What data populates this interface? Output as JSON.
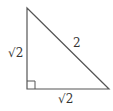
{
  "diagram": {
    "type": "right-triangle",
    "vertices": {
      "top": [
        27,
        8
      ],
      "right_angle": [
        27,
        89
      ],
      "right": [
        109,
        89
      ]
    },
    "right_angle_marker": true,
    "labels": {
      "left_leg": "√2",
      "bottom_leg": "√2",
      "hypotenuse": "2"
    },
    "stroke_color": "#555555",
    "label_color": "#333333"
  }
}
